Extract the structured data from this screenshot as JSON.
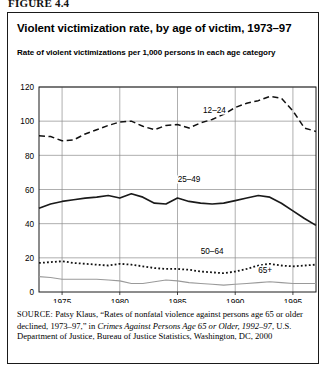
{
  "figure": {
    "number": "FIGURE 4.4"
  },
  "chart_header": {
    "title": "Violent victimization rate, by age of victim, 1973–97",
    "subtitle": "Rate of violent victimizations per 1,000 persons in each age category"
  },
  "source": {
    "label": "SOURCE:",
    "text_1": " Patsy Klaus, “Rates of nonfatal violence against persons age 65 or older declined, 1973–97,” in ",
    "italic_1": "Crimes Against Persons Age 65 or Older, 1992–97",
    "text_2": ", U.S. Department of Justice, Bureau of Justice Statistics, Washington, DC, 2000"
  },
  "chart_data": {
    "type": "line",
    "title": "Violent victimization rate, by age of victim, 1973–97",
    "subtitle": "Rate of violent victimizations per 1,000 persons in each age category",
    "xlabel": "",
    "ylabel": "",
    "xlim": [
      1973,
      1997
    ],
    "ylim": [
      0,
      120
    ],
    "ytick_values": [
      0,
      20,
      40,
      60,
      80,
      100,
      120
    ],
    "ytick_labels": [
      "0",
      "20",
      "40",
      "60",
      "80",
      "100",
      "120"
    ],
    "xtick_values": [
      1975,
      1980,
      1985,
      1990,
      1995
    ],
    "xtick_labels": [
      "1975",
      "1980",
      "1985",
      "1990",
      "1995"
    ],
    "grid": "both",
    "legend": "inline-annotations",
    "x": [
      1973,
      1974,
      1975,
      1976,
      1977,
      1978,
      1979,
      1980,
      1981,
      1982,
      1983,
      1984,
      1985,
      1986,
      1987,
      1988,
      1989,
      1990,
      1991,
      1992,
      1993,
      1994,
      1995,
      1996,
      1997
    ],
    "series": [
      {
        "name": "12–24",
        "label": "12–24",
        "style": "dashed",
        "color": "#111111",
        "label_x": 1988.2,
        "label_y": 104.5,
        "values": [
          91.5,
          91.0,
          88.5,
          89.0,
          92.5,
          95.0,
          97.5,
          99.5,
          100.0,
          97.0,
          95.0,
          97.5,
          98.0,
          96.0,
          99.0,
          101.0,
          104.0,
          108.0,
          110.5,
          112.0,
          114.5,
          113.5,
          106.0,
          96.0,
          94.0
        ]
      },
      {
        "name": "25–49",
        "label": "25–49",
        "style": "solid",
        "color": "#1a1a1a",
        "label_x": 1986.0,
        "label_y": 64.5,
        "values": [
          49.0,
          51.5,
          53.0,
          54.0,
          55.0,
          55.5,
          56.5,
          55.0,
          57.5,
          55.5,
          52.0,
          51.5,
          55.0,
          53.0,
          52.0,
          51.5,
          52.0,
          53.5,
          55.0,
          56.5,
          55.5,
          52.0,
          47.5,
          43.0,
          39.0
        ]
      },
      {
        "name": "50–64",
        "label": "50–64",
        "style": "dotted",
        "color": "#111111",
        "label_x": 1988.0,
        "label_y": 22.0,
        "values": [
          17.0,
          17.5,
          18.0,
          17.0,
          16.5,
          16.0,
          15.5,
          16.5,
          16.0,
          15.0,
          14.0,
          13.5,
          13.5,
          13.0,
          12.0,
          11.5,
          11.0,
          12.0,
          13.5,
          15.5,
          16.5,
          15.5,
          15.0,
          15.5,
          16.0
        ]
      },
      {
        "name": "65+",
        "label": "65+",
        "style": "solid-gray",
        "color": "#9a9a9a",
        "label_x": 1992.6,
        "label_y": 11.0,
        "values": [
          9.0,
          8.5,
          7.5,
          7.5,
          7.5,
          7.5,
          7.0,
          6.5,
          5.0,
          5.0,
          6.0,
          7.0,
          6.5,
          5.5,
          5.0,
          4.5,
          4.0,
          4.5,
          5.0,
          5.5,
          6.0,
          5.5,
          5.0,
          5.0,
          5.0
        ]
      }
    ]
  }
}
